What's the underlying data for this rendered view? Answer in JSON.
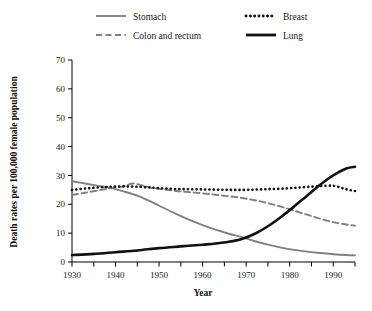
{
  "chart_data": {
    "type": "line",
    "title": "",
    "xlabel": "Year",
    "ylabel": "Death rates per 100,000 female population",
    "xlim": [
      1930,
      1995
    ],
    "ylim": [
      0,
      70
    ],
    "yticks": [
      0,
      10,
      20,
      30,
      40,
      50,
      60,
      70
    ],
    "ytick_labels": [
      "0",
      "10",
      "20",
      "30",
      "40",
      "50",
      "60",
      "70"
    ],
    "xticks": [
      1930,
      1935,
      1940,
      1945,
      1950,
      1955,
      1960,
      1965,
      1970,
      1975,
      1980,
      1985,
      1990,
      1995
    ],
    "xtick_labels": [
      "1930",
      "",
      "1940",
      "",
      "1950",
      "",
      "1960",
      "",
      "1970",
      "",
      "1980",
      "",
      "1990",
      ""
    ],
    "grid": false,
    "legend_position": "top",
    "series": [
      {
        "name": "Stomach",
        "color": "#808080",
        "style": "solid",
        "width": 1.9,
        "dash": "",
        "x": [
          1930,
          1933,
          1936,
          1939,
          1942,
          1945,
          1948,
          1951,
          1954,
          1957,
          1960,
          1963,
          1966,
          1969,
          1972,
          1975,
          1978,
          1981,
          1984,
          1987,
          1990,
          1993,
          1995
        ],
        "y": [
          28.0,
          27.2,
          26.4,
          25.6,
          24.4,
          23.0,
          21.0,
          18.8,
          16.6,
          14.6,
          12.8,
          11.2,
          9.8,
          8.6,
          7.2,
          6.0,
          5.0,
          4.2,
          3.6,
          3.1,
          2.7,
          2.4,
          2.3
        ]
      },
      {
        "name": "Colon and rectum",
        "color": "#808080",
        "style": "dashed",
        "width": 1.9,
        "dash": "6,3.5",
        "x": [
          1930,
          1933,
          1936,
          1939,
          1942,
          1944,
          1946,
          1948,
          1951,
          1954,
          1957,
          1960,
          1963,
          1966,
          1969,
          1972,
          1975,
          1978,
          1981,
          1984,
          1987,
          1990,
          1993,
          1995
        ],
        "y": [
          23.2,
          24.0,
          24.8,
          25.6,
          26.3,
          27.2,
          26.6,
          25.8,
          25.2,
          24.6,
          24.2,
          23.8,
          23.3,
          22.8,
          22.2,
          21.4,
          20.4,
          19.2,
          17.8,
          16.4,
          15.0,
          13.8,
          13.0,
          12.6
        ]
      },
      {
        "name": "Breast",
        "color": "#111111",
        "style": "dotted",
        "width": 2.6,
        "dash": "0.1,4.2",
        "x": [
          1930,
          1934,
          1938,
          1942,
          1946,
          1950,
          1954,
          1958,
          1962,
          1966,
          1970,
          1974,
          1978,
          1982,
          1986,
          1990,
          1993,
          1995
        ],
        "y": [
          25.0,
          25.6,
          26.0,
          26.2,
          26.0,
          25.6,
          25.3,
          25.2,
          25.1,
          25.0,
          25.0,
          25.2,
          25.4,
          25.8,
          26.2,
          26.4,
          25.2,
          24.6
        ]
      },
      {
        "name": "Lung",
        "color": "#111111",
        "style": "solid",
        "width": 2.6,
        "dash": "",
        "x": [
          1930,
          1935,
          1940,
          1945,
          1950,
          1955,
          1960,
          1963,
          1966,
          1969,
          1972,
          1975,
          1978,
          1981,
          1984,
          1987,
          1990,
          1993,
          1995
        ],
        "y": [
          2.4,
          2.8,
          3.4,
          4.0,
          4.8,
          5.4,
          6.0,
          6.4,
          7.0,
          8.0,
          9.8,
          12.4,
          15.6,
          19.2,
          23.0,
          26.8,
          30.0,
          32.4,
          33.0
        ]
      }
    ]
  },
  "legend": {
    "items": [
      {
        "label": "Stomach",
        "swatch": "solid-gray-line"
      },
      {
        "label": "Breast",
        "swatch": "dotted-black-line"
      },
      {
        "label": "Colon and rectum",
        "swatch": "dashed-gray-line"
      },
      {
        "label": "Lung",
        "swatch": "solid-black-line"
      }
    ]
  }
}
